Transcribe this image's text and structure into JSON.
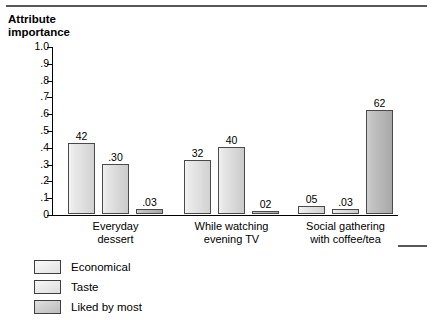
{
  "title": "Attribute\nimportance",
  "colors": {
    "rule": "#58585a",
    "axis": "#000000",
    "bar_border": "#4a4a4a",
    "series_economical": "#eaeaea",
    "series_taste": "#e6e6e6",
    "series_liked_by_most": "#c2c2c2"
  },
  "legend": {
    "items": [
      {
        "label": "Economical",
        "swatch": "series-swatch-economical"
      },
      {
        "label": "Taste",
        "swatch": "series-swatch-taste"
      },
      {
        "label": "Liked by most",
        "swatch": "series-swatch-liked-by-most"
      }
    ]
  },
  "y_axis": {
    "ticks": [
      {
        "label": "1.0",
        "value": 1.0
      },
      {
        "label": ".9",
        "value": 0.9
      },
      {
        "label": ".8",
        "value": 0.8
      },
      {
        "label": ".7",
        "value": 0.7
      },
      {
        "label": ".6",
        "value": 0.6
      },
      {
        "label": ".5",
        "value": 0.5
      },
      {
        "label": ".4",
        "value": 0.4
      },
      {
        "label": ".3",
        "value": 0.3
      },
      {
        "label": ".2",
        "value": 0.2
      },
      {
        "label": ".1",
        "value": 0.1
      },
      {
        "label": "0",
        "value": 0.0
      }
    ]
  },
  "categories": [
    {
      "label": "Everyday\ndessert"
    },
    {
      "label": "While watching\nevening TV"
    },
    {
      "label": "Social gathering\nwith coffee/tea"
    }
  ],
  "bars": [
    {
      "group": 0,
      "series": 0,
      "value": 0.42,
      "label": "42"
    },
    {
      "group": 0,
      "series": 1,
      "value": 0.3,
      "label": ".30"
    },
    {
      "group": 0,
      "series": 2,
      "value": 0.03,
      "label": ".03"
    },
    {
      "group": 1,
      "series": 0,
      "value": 0.32,
      "label": "32"
    },
    {
      "group": 1,
      "series": 1,
      "value": 0.4,
      "label": "40"
    },
    {
      "group": 1,
      "series": 2,
      "value": 0.02,
      "label": "02"
    },
    {
      "group": 2,
      "series": 0,
      "value": 0.05,
      "label": "05"
    },
    {
      "group": 2,
      "series": 1,
      "value": 0.03,
      "label": ".03"
    },
    {
      "group": 2,
      "series": 2,
      "value": 0.62,
      "label": "62"
    }
  ],
  "chart_data": {
    "type": "bar",
    "title": "Attribute importance",
    "xlabel": "",
    "ylabel": "Attribute importance",
    "ylim": [
      0,
      1.0
    ],
    "ytick_step": 0.1,
    "grid": false,
    "legend_position": "bottom-left",
    "categories": [
      "Everyday dessert",
      "While watching evening TV",
      "Social gathering with coffee/tea"
    ],
    "series": [
      {
        "name": "Economical",
        "values": [
          0.42,
          0.32,
          0.05
        ],
        "labels": [
          "42",
          "32",
          "05"
        ]
      },
      {
        "name": "Taste",
        "values": [
          0.3,
          0.4,
          0.03
        ],
        "labels": [
          ".30",
          "40",
          ".03"
        ]
      },
      {
        "name": "Liked by most",
        "values": [
          0.03,
          0.02,
          0.62
        ],
        "labels": [
          ".03",
          "02",
          "62"
        ]
      }
    ]
  }
}
